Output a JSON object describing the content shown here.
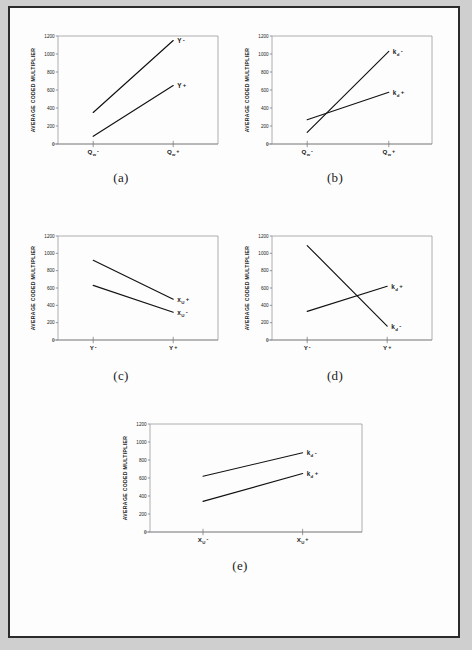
{
  "page": {
    "background_color": "#cfcfcf",
    "sheet_color": "#fdfdfd",
    "border_color": "#2b2b2b"
  },
  "axis": {
    "ylabel": "AVERAGE CODED MULTIPLIER",
    "yticks": [
      "1200",
      "1000",
      "800",
      "600",
      "400",
      "200",
      "0"
    ],
    "ylim_low": 0,
    "ylim_high": 1200
  },
  "captions": {
    "a": "(a)",
    "b": "(b)",
    "c": "(c)",
    "d": "(d)",
    "e": "(e)"
  },
  "chart_data": [
    {
      "id": "a",
      "type": "line",
      "title": "(a)",
      "xlabel": "",
      "ylabel": "AVERAGE CODED MULTIPLIER",
      "ylim": [
        0,
        1200
      ],
      "grid": false,
      "legend": "inline-endpoint-labels",
      "categories": [
        "Qw -",
        "Qw +"
      ],
      "xtick_parts": [
        {
          "main": "Q",
          "sub": "w",
          "sign": "-"
        },
        {
          "main": "Q",
          "sub": "w",
          "sign": "+"
        }
      ],
      "series": [
        {
          "name": "Y -",
          "label_parts": {
            "main": "Y",
            "sub": "",
            "sign": "-"
          },
          "values": [
            350,
            1150
          ]
        },
        {
          "name": "Y +",
          "label_parts": {
            "main": "Y",
            "sub": "",
            "sign": "+"
          },
          "values": [
            85,
            650
          ]
        }
      ]
    },
    {
      "id": "b",
      "type": "line",
      "title": "(b)",
      "xlabel": "",
      "ylabel": "AVERAGE CODED MULTIPLIER",
      "ylim": [
        0,
        1200
      ],
      "grid": false,
      "legend": "inline-endpoint-labels",
      "categories": [
        "Qw -",
        "Qw +"
      ],
      "xtick_parts": [
        {
          "main": "Q",
          "sub": "w",
          "sign": "-"
        },
        {
          "main": "Q",
          "sub": "w",
          "sign": "+"
        }
      ],
      "series": [
        {
          "name": "kd -",
          "label_parts": {
            "main": "k",
            "sub": "d",
            "sign": "-"
          },
          "values": [
            130,
            1030
          ]
        },
        {
          "name": "kd +",
          "label_parts": {
            "main": "k",
            "sub": "d",
            "sign": "+"
          },
          "values": [
            270,
            575
          ]
        }
      ]
    },
    {
      "id": "c",
      "type": "line",
      "title": "(c)",
      "xlabel": "",
      "ylabel": "AVERAGE CODED MULTIPLIER",
      "ylim": [
        0,
        1200
      ],
      "grid": false,
      "legend": "inline-endpoint-labels",
      "categories": [
        "Y -",
        "Y +"
      ],
      "xtick_parts": [
        {
          "main": "Y",
          "sub": "",
          "sign": "-"
        },
        {
          "main": "Y",
          "sub": "",
          "sign": "+"
        }
      ],
      "series": [
        {
          "name": "xU +",
          "label_parts": {
            "main": "x",
            "sub": "U",
            "sign": "+"
          },
          "values": [
            920,
            470
          ]
        },
        {
          "name": "xU -",
          "label_parts": {
            "main": "x",
            "sub": "U",
            "sign": "-"
          },
          "values": [
            630,
            320
          ]
        }
      ]
    },
    {
      "id": "d",
      "type": "line",
      "title": "(d)",
      "xlabel": "",
      "ylabel": "AVERAGE CODED MULTIPLIER",
      "ylim": [
        0,
        1200
      ],
      "grid": false,
      "legend": "inline-endpoint-labels",
      "categories": [
        "Y -",
        "Y +"
      ],
      "xtick_parts": [
        {
          "main": "Y",
          "sub": "",
          "sign": "-"
        },
        {
          "main": "Y",
          "sub": "",
          "sign": "+"
        }
      ],
      "series": [
        {
          "name": "kd -",
          "label_parts": {
            "main": "k",
            "sub": "d",
            "sign": "-"
          },
          "values": [
            1090,
            160
          ]
        },
        {
          "name": "kd +",
          "label_parts": {
            "main": "k",
            "sub": "d",
            "sign": "+"
          },
          "values": [
            330,
            620
          ]
        }
      ]
    },
    {
      "id": "e",
      "type": "line",
      "title": "(e)",
      "xlabel": "",
      "ylabel": "AVERAGE CODED MULTIPLIER",
      "ylim": [
        0,
        1200
      ],
      "grid": false,
      "legend": "inline-endpoint-labels",
      "categories": [
        "XU -",
        "XU +"
      ],
      "xtick_parts": [
        {
          "main": "X",
          "sub": "U",
          "sign": "-"
        },
        {
          "main": "X",
          "sub": "U",
          "sign": "+"
        }
      ],
      "series": [
        {
          "name": "kd -",
          "label_parts": {
            "main": "k",
            "sub": "d",
            "sign": "-"
          },
          "values": [
            620,
            880
          ]
        },
        {
          "name": "kd +",
          "label_parts": {
            "main": "k",
            "sub": "d",
            "sign": "+"
          },
          "values": [
            340,
            650
          ]
        }
      ]
    }
  ]
}
